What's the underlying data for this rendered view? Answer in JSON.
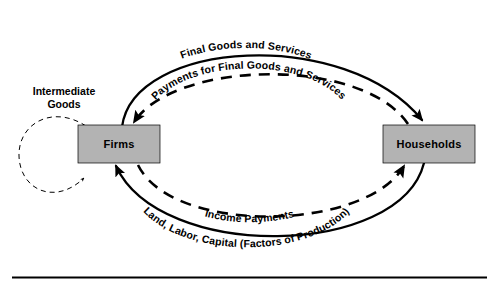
{
  "diagram": {
    "type": "circular-flow-diagram",
    "background_color": "#ffffff",
    "line_color": "#000000",
    "box_fill_color": "#b3b3b3",
    "box_border_color": "#000000",
    "nodes": [
      {
        "id": "firms",
        "label": "Firms",
        "x": 78,
        "y": 125,
        "width": 82,
        "height": 38
      },
      {
        "id": "households",
        "label": "Households",
        "x": 383,
        "y": 125,
        "width": 92,
        "height": 38
      }
    ],
    "flows": [
      {
        "id": "final-goods-and-services",
        "label": "Final Goods and Services",
        "style": "solid",
        "direction": "firms-to-households",
        "position": "top-outer"
      },
      {
        "id": "payments-for-final-goods-and-services",
        "label": "Payments for Final Goods and Services",
        "style": "dashed",
        "direction": "households-to-firms",
        "position": "top-inner"
      },
      {
        "id": "income-payments",
        "label": "Income Payments",
        "style": "dashed",
        "direction": "firms-to-households",
        "position": "bottom-inner"
      },
      {
        "id": "land-labor-capital",
        "label": "Land, Labor, Capital (Factors of Production)",
        "style": "solid",
        "direction": "households-to-firms",
        "position": "bottom-outer"
      },
      {
        "id": "intermediate-goods",
        "label_line_1": "Intermediate",
        "label_line_2": "Goods",
        "style": "dashed",
        "direction": "firms-to-firms",
        "position": "left-loop"
      }
    ],
    "footer_rule": {
      "present": true,
      "color": "#000000"
    }
  }
}
